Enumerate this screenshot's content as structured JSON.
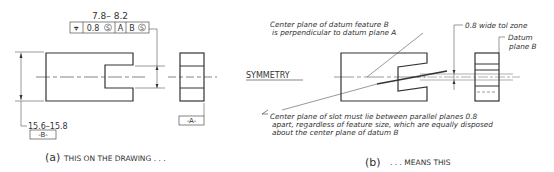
{
  "panel_a": {
    "caption_letter": "(a)",
    "caption": "THIS ON THE DRAWING . . .",
    "slot_dimension": "7.8– 8.2",
    "feature_control_frame": {
      "symbol": "⌖",
      "tolerance": "0.8",
      "modifier1": "S",
      "datum1": "A",
      "datum2": "B",
      "modifier2": "S"
    },
    "overall_dimension": "15.6–15.8",
    "datum_b_label": "-B-",
    "datum_a_label": "-A-"
  },
  "panel_b": {
    "caption_letter": "(b)",
    "caption": ". . . MEANS THIS",
    "heading": "SYMMETRY",
    "note_top_line1": "Center plane of datum feature B",
    "note_top_line2": "is perpendicular to datum plane A",
    "note_tol_zone": "0.8 wide tol zone",
    "note_datum_line1": "Datum",
    "note_datum_line2": "plane B",
    "note_bottom_line1": "Center plane of slot must lie between parallel planes 0.8",
    "note_bottom_line2": "apart, regardless of feature size, which are equally disposed",
    "note_bottom_line3": "about the center plane of datum B"
  }
}
